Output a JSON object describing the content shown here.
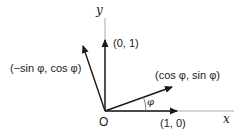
{
  "diagram": {
    "axes": {
      "x_label": "x",
      "y_label": "y",
      "origin_label": "O"
    },
    "vectors": [
      {
        "name": "e1",
        "label": "(1, 0)"
      },
      {
        "name": "e2",
        "label": "(0, 1)"
      },
      {
        "name": "rotated-e1",
        "label": "(cos φ, sin φ)"
      },
      {
        "name": "rotated-e2",
        "label": "(−sin φ, cos φ)"
      }
    ],
    "angle_label": "φ",
    "colors": {
      "axis": "#aaaaaa",
      "vector": "#1a1a1a"
    }
  }
}
